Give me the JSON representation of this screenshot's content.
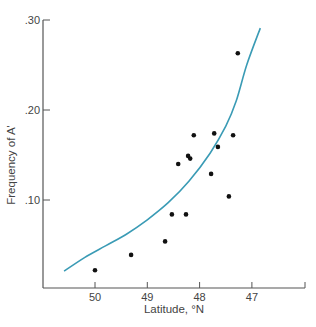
{
  "chart_data": {
    "type": "scatter",
    "title": "",
    "xlabel": "Latitude, °N",
    "ylabel": "Frequency of A'",
    "x_reversed": true,
    "xlim": [
      50.6,
      46.4
    ],
    "ylim": [
      0.0,
      0.3
    ],
    "x_ticks": [
      50,
      49,
      48,
      47
    ],
    "x_tick_labels": [
      "50",
      "49",
      "48",
      "47"
    ],
    "y_ticks": [
      0.1,
      0.2,
      0.3
    ],
    "y_tick_labels": [
      ".10",
      ".20",
      ".30"
    ],
    "grid": false,
    "legend": null,
    "series": [
      {
        "name": "observed",
        "kind": "points",
        "color": "#111111",
        "points": [
          {
            "x": 50.0,
            "y": 0.022
          },
          {
            "x": 49.31,
            "y": 0.039
          },
          {
            "x": 48.66,
            "y": 0.054
          },
          {
            "x": 48.53,
            "y": 0.084
          },
          {
            "x": 48.26,
            "y": 0.084
          },
          {
            "x": 48.41,
            "y": 0.14
          },
          {
            "x": 48.22,
            "y": 0.149
          },
          {
            "x": 48.18,
            "y": 0.146
          },
          {
            "x": 48.11,
            "y": 0.172
          },
          {
            "x": 47.72,
            "y": 0.174
          },
          {
            "x": 47.65,
            "y": 0.159
          },
          {
            "x": 47.78,
            "y": 0.129
          },
          {
            "x": 47.44,
            "y": 0.104
          },
          {
            "x": 47.36,
            "y": 0.172
          },
          {
            "x": 47.27,
            "y": 0.263
          }
        ]
      },
      {
        "name": "fitted curve",
        "kind": "line",
        "color": "#3a9bb5",
        "points": [
          {
            "x": 50.59,
            "y": 0.021
          },
          {
            "x": 50.2,
            "y": 0.036
          },
          {
            "x": 49.8,
            "y": 0.049
          },
          {
            "x": 49.4,
            "y": 0.062
          },
          {
            "x": 49.0,
            "y": 0.078
          },
          {
            "x": 48.6,
            "y": 0.097
          },
          {
            "x": 48.2,
            "y": 0.121
          },
          {
            "x": 47.8,
            "y": 0.152
          },
          {
            "x": 47.5,
            "y": 0.182
          },
          {
            "x": 47.3,
            "y": 0.21
          },
          {
            "x": 47.1,
            "y": 0.25
          },
          {
            "x": 46.84,
            "y": 0.291
          }
        ]
      }
    ]
  }
}
